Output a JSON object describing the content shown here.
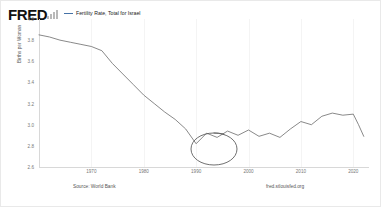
{
  "header": {
    "logo_text": "FRED",
    "logo_icon": "bar-chart-icon",
    "legend": {
      "marker": "line-swatch",
      "label": "Fertility Rate, Total for Israel",
      "color": "#4572a7"
    }
  },
  "footer": {
    "source": "Source: World Bank",
    "url": "fred.stlouisfed.org"
  },
  "annotation": {
    "shape": "hand-drawn-ellipse",
    "target_label": "trough around 1990",
    "color": "#555555"
  },
  "chart_data": {
    "type": "line",
    "title": "Fertility Rate, Total for Israel",
    "xlabel": "",
    "ylabel": "Births per Woman",
    "xlim": [
      1960,
      2023
    ],
    "ylim": [
      2.6,
      4.0
    ],
    "grid": false,
    "legend_position": "top",
    "line_color": "#4572a7",
    "source": "Source: World Bank",
    "yticks": [
      "4.0",
      "3.8",
      "3.6",
      "3.4",
      "3.2",
      "3.0",
      "2.8",
      "2.6"
    ],
    "ytick_values": [
      4.0,
      3.8,
      3.6,
      3.4,
      3.2,
      3.0,
      2.8,
      2.6
    ],
    "xticks": [
      "1970",
      "1980",
      "1990",
      "2000",
      "2010",
      "2020"
    ],
    "xtick_values": [
      1970,
      1980,
      1990,
      2000,
      2010,
      2020
    ],
    "series": [
      {
        "name": "Fertility Rate, Total for Israel",
        "x": [
          1960,
          1962,
          1964,
          1966,
          1968,
          1970,
          1972,
          1974,
          1976,
          1978,
          1980,
          1982,
          1984,
          1986,
          1988,
          1990,
          1992,
          1994,
          1996,
          1998,
          2000,
          2002,
          2004,
          2006,
          2008,
          2010,
          2012,
          2014,
          2016,
          2018,
          2020,
          2021,
          2022
        ],
        "values": [
          3.85,
          3.83,
          3.8,
          3.78,
          3.76,
          3.74,
          3.7,
          3.58,
          3.48,
          3.38,
          3.28,
          3.2,
          3.12,
          3.05,
          2.96,
          2.82,
          2.92,
          2.88,
          2.94,
          2.9,
          2.95,
          2.89,
          2.92,
          2.88,
          2.96,
          3.03,
          3.0,
          3.08,
          3.11,
          3.09,
          3.1,
          3.0,
          2.89
        ]
      }
    ],
    "annotations": [
      {
        "type": "ellipse",
        "x": 1990,
        "y": 2.82,
        "note": "circled local minimum"
      }
    ]
  }
}
